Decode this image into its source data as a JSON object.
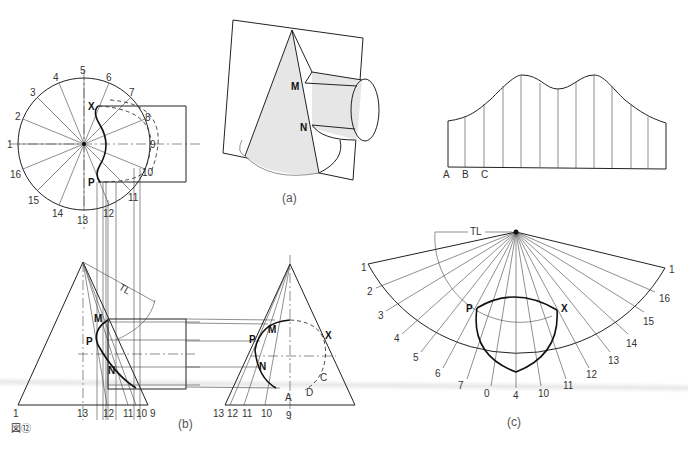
{
  "figure": {
    "number_label": "図⑫"
  },
  "view_a": {
    "caption": "(a)",
    "points": [
      "M",
      "N"
    ]
  },
  "view_b": {
    "caption": "(b)",
    "plan_circle_divisions": [
      "1",
      "2",
      "3",
      "4",
      "5",
      "6",
      "7",
      "8",
      "9",
      "10",
      "11",
      "12",
      "13",
      "14",
      "15",
      "16"
    ],
    "plan_points": [
      "X",
      "P"
    ],
    "elevation_left": {
      "points": [
        "M",
        "P",
        "N"
      ],
      "true_length": "TL",
      "base_labels": [
        "1",
        "13",
        "12",
        "11",
        "10",
        "9"
      ]
    },
    "elevation_right": {
      "points": [
        "P",
        "M",
        "N",
        "X",
        "A",
        "B",
        "C",
        "D"
      ],
      "base_labels": [
        "13",
        "12",
        "11",
        "10",
        "9"
      ]
    }
  },
  "cylinder_development": {
    "base_labels": [
      "A",
      "B",
      "C"
    ],
    "element_count": 13
  },
  "view_c": {
    "caption": "(c)",
    "true_length": "TL",
    "arc_labels": [
      "1",
      "2",
      "3",
      "4",
      "5",
      "6",
      "7",
      "0",
      "4",
      "10",
      "11",
      "12",
      "13",
      "14",
      "15",
      "16",
      "1"
    ],
    "points": [
      "P",
      "X"
    ]
  },
  "labels": {
    "M": "M",
    "N": "N",
    "P": "P",
    "X": "X",
    "TL": "TL",
    "A": "A",
    "B": "B",
    "C": "C",
    "D": "D"
  }
}
